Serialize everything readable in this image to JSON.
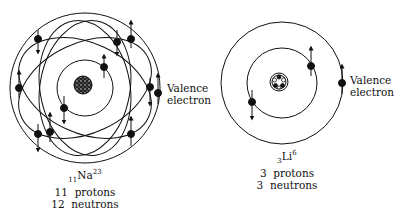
{
  "atoms": [
    {
      "id": "sodium",
      "symbol": "Na",
      "atomic_number": "11",
      "mass_number": "23",
      "protons_label": "11  protons",
      "neutrons_label": "12  neutrons",
      "valence_label_line1": "Valence",
      "valence_label_line2": "electron",
      "electron_count": 11
    },
    {
      "id": "lithium",
      "symbol": "Li",
      "atomic_number": "3",
      "mass_number": "6",
      "protons_label": "3  protons",
      "neutrons_label": "3  neutrons",
      "valence_label_line1": "Valence",
      "valence_label_line2": "electron",
      "electron_count": 3
    }
  ],
  "colors": {
    "line": "#111111",
    "background": "#ffffff"
  }
}
